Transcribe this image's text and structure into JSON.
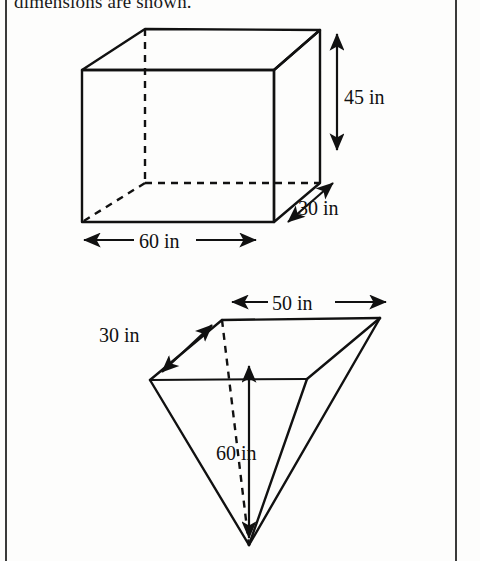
{
  "page": {
    "cut_off_text": "dimensions are shown.",
    "background_color": "#fdfdfc",
    "ink_color": "#111111",
    "frame_color": "#3a3a3a"
  },
  "figures": [
    {
      "name": "rectangular-prism",
      "shape": "rectangular prism",
      "labels": {
        "width": "60 in",
        "depth": "30 in",
        "height": "45 in"
      }
    },
    {
      "name": "inverted-rectangular-pyramid",
      "shape": "inverted rectangular pyramid",
      "labels": {
        "base_length": "50 in",
        "base_width": "30 in",
        "height": "60 in"
      }
    }
  ],
  "dimension_labels": {
    "prism_height": "45 in",
    "prism_depth": "30 in",
    "prism_width": "60 in",
    "pyramid_length": "50 in",
    "pyramid_width": "30 in",
    "pyramid_height": "60 in"
  }
}
